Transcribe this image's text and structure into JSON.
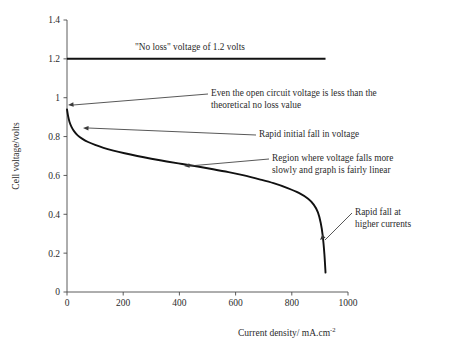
{
  "chart_data": {
    "type": "line",
    "title": "",
    "xlabel": "Current density/ mA.cm",
    "xlabel_sup": "-2",
    "ylabel": "Cell voltage/volts",
    "xlim": [
      0,
      1000
    ],
    "ylim": [
      0,
      1.4
    ],
    "grid": false,
    "legend": "none",
    "xticks": [
      "0",
      "200",
      "400",
      "600",
      "800",
      "1000"
    ],
    "xtick_values": [
      0,
      200,
      400,
      600,
      800,
      1000
    ],
    "yticks": [
      "0",
      "0.2",
      "0.4",
      "0.6",
      "0.8",
      "1",
      "1.2",
      "1.4"
    ],
    "ytick_values": [
      0,
      0.2,
      0.4,
      0.6,
      0.8,
      1.0,
      1.2,
      1.4
    ],
    "series": [
      {
        "name": "No loss voltage",
        "style": "horizontal-line",
        "value": 1.2,
        "x_start": 0,
        "x_end": 920,
        "color": "#111111"
      },
      {
        "name": "Cell polarization curve",
        "style": "curve",
        "color": "#111111",
        "x": [
          0,
          4,
          9,
          16,
          25,
          38,
          55,
          75,
          100,
          130,
          165,
          205,
          250,
          300,
          355,
          410,
          465,
          520,
          575,
          630,
          685,
          735,
          785,
          825,
          858,
          878,
          893,
          903,
          910,
          916,
          920
        ],
        "values": [
          0.94,
          0.905,
          0.875,
          0.85,
          0.828,
          0.806,
          0.788,
          0.772,
          0.757,
          0.742,
          0.728,
          0.714,
          0.7,
          0.686,
          0.672,
          0.659,
          0.646,
          0.632,
          0.617,
          0.6,
          0.58,
          0.56,
          0.535,
          0.51,
          0.48,
          0.45,
          0.41,
          0.355,
          0.29,
          0.195,
          0.1
        ]
      }
    ],
    "annotations": [
      {
        "id": "no-loss-note",
        "text": "\"No loss\" voltage of 1.2 volts",
        "x_px": 135,
        "y_px": 42,
        "has_arrow": false
      },
      {
        "id": "open-circuit-note",
        "line1": "Even the open circuit voltage is less than the",
        "line2": "theoretical no loss value",
        "x_px": 211,
        "y_px": 88,
        "has_arrow": true,
        "arrow_target": [
          68,
          105
        ]
      },
      {
        "id": "rapid-initial-fall-note",
        "text": "Rapid initial fall in voltage",
        "x_px": 259,
        "y_px": 129,
        "has_arrow": true,
        "arrow_target": [
          83,
          128
        ]
      },
      {
        "id": "linear-region-note",
        "line1": "Region where voltage falls more",
        "line2": "slowly and graph is fairly linear",
        "x_px": 272,
        "y_px": 153,
        "has_arrow": true,
        "arrow_target": [
          184,
          166
        ]
      },
      {
        "id": "rapid-fall-high-current-note",
        "line1": "Rapid fall at",
        "line2": "higher currents",
        "x_px": 355,
        "y_px": 207,
        "has_arrow": true,
        "arrow_target": [
          320,
          240
        ]
      }
    ],
    "colors": {
      "curve": "#111111",
      "axis": "#4a4a4a",
      "text": "#2b2b2b",
      "background": "#ffffff"
    }
  }
}
